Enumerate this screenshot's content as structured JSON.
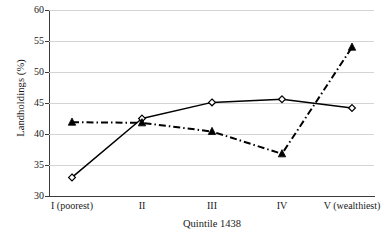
{
  "chart_data": {
    "type": "line",
    "title": "",
    "subtitle": "",
    "xlabel": "Quintile 1438",
    "ylabel": "Landholdings (%)",
    "categories": [
      "I (poorest)",
      "II",
      "III",
      "IV",
      "V (wealthiest)"
    ],
    "ylim": [
      30,
      60
    ],
    "yticks": [
      30,
      35,
      40,
      45,
      50,
      55,
      60
    ],
    "ytick_labels": [
      "30",
      "35",
      "40",
      "45",
      "50",
      "55",
      "60"
    ],
    "grid": "horizontal",
    "legend": "none",
    "series": [
      {
        "name": "series-solid-diamond",
        "values": [
          33.0,
          42.5,
          45.1,
          45.6,
          44.2
        ],
        "line_style": "solid",
        "marker": "open-diamond",
        "color": "#000000"
      },
      {
        "name": "series-dashdot-triangle",
        "values": [
          41.9,
          41.8,
          40.4,
          36.8,
          54.0
        ],
        "line_style": "dash-dot",
        "marker": "filled-triangle",
        "color": "#000000"
      }
    ],
    "colors": {
      "axis": "#3a3a3a",
      "grid": "#d4d4d4",
      "series": "#000000",
      "background": "#ffffff"
    }
  }
}
